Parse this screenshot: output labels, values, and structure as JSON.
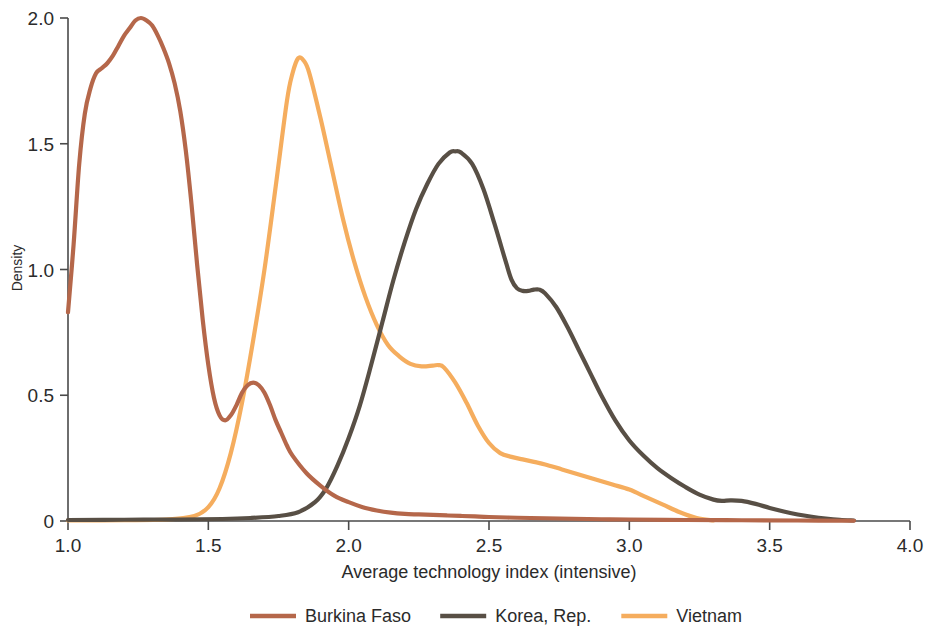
{
  "chart_data": {
    "type": "line",
    "title": "",
    "subtitle": "",
    "xlabel": "Average technology index (intensive)",
    "ylabel": "Density",
    "xlim": [
      1.0,
      4.0
    ],
    "ylim": [
      0,
      2.0
    ],
    "xticks": [
      1.0,
      1.5,
      2.0,
      2.5,
      3.0,
      3.5,
      4.0
    ],
    "xticklabels": [
      "1.0",
      "1.5",
      "2.0",
      "2.5",
      "3.0",
      "3.5",
      "4.0"
    ],
    "yticks": [
      0,
      0.5,
      1.0,
      1.5,
      2.0
    ],
    "yticklabels": [
      "0",
      "0.5",
      "1.0",
      "1.5",
      "2.0"
    ],
    "grid": false,
    "legend_position": "bottom",
    "series": [
      {
        "name": "Burkina Faso",
        "color": "#b5674a",
        "x": [
          1.0,
          1.02,
          1.04,
          1.06,
          1.08,
          1.1,
          1.12,
          1.14,
          1.16,
          1.18,
          1.2,
          1.22,
          1.24,
          1.26,
          1.28,
          1.3,
          1.32,
          1.34,
          1.36,
          1.38,
          1.4,
          1.42,
          1.44,
          1.46,
          1.48,
          1.5,
          1.52,
          1.54,
          1.56,
          1.58,
          1.6,
          1.62,
          1.64,
          1.66,
          1.68,
          1.7,
          1.72,
          1.74,
          1.76,
          1.78,
          1.8,
          1.85,
          1.9,
          1.95,
          2.0,
          2.05,
          2.1,
          2.15,
          2.2,
          2.25,
          2.3,
          2.35,
          2.4,
          2.45,
          2.5,
          2.6,
          2.7,
          2.8,
          2.9,
          3.0,
          3.2,
          3.4,
          3.6,
          3.8
        ],
        "y": [
          0.83,
          1.1,
          1.42,
          1.62,
          1.72,
          1.78,
          1.8,
          1.82,
          1.85,
          1.89,
          1.93,
          1.96,
          1.99,
          2.0,
          1.99,
          1.97,
          1.93,
          1.88,
          1.82,
          1.74,
          1.63,
          1.47,
          1.26,
          1.02,
          0.8,
          0.62,
          0.49,
          0.42,
          0.4,
          0.42,
          0.46,
          0.51,
          0.54,
          0.55,
          0.54,
          0.51,
          0.46,
          0.4,
          0.35,
          0.3,
          0.26,
          0.19,
          0.14,
          0.1,
          0.075,
          0.055,
          0.042,
          0.033,
          0.028,
          0.026,
          0.024,
          0.022,
          0.02,
          0.018,
          0.016,
          0.013,
          0.011,
          0.009,
          0.007,
          0.006,
          0.004,
          0.003,
          0.002,
          0.001
        ]
      },
      {
        "name": "Korea, Rep.",
        "color": "#584f45",
        "x": [
          1.0,
          1.2,
          1.4,
          1.55,
          1.65,
          1.75,
          1.82,
          1.88,
          1.92,
          1.96,
          2.0,
          2.04,
          2.08,
          2.12,
          2.16,
          2.2,
          2.24,
          2.28,
          2.32,
          2.36,
          2.38,
          2.4,
          2.44,
          2.48,
          2.52,
          2.56,
          2.58,
          2.6,
          2.62,
          2.64,
          2.66,
          2.68,
          2.7,
          2.74,
          2.78,
          2.82,
          2.86,
          2.9,
          2.95,
          3.0,
          3.05,
          3.1,
          3.15,
          3.2,
          3.25,
          3.3,
          3.33,
          3.36,
          3.4,
          3.45,
          3.5,
          3.55,
          3.6,
          3.65,
          3.7,
          3.75,
          3.8
        ],
        "y": [
          0.004,
          0.005,
          0.006,
          0.008,
          0.012,
          0.02,
          0.035,
          0.075,
          0.13,
          0.22,
          0.33,
          0.46,
          0.62,
          0.79,
          0.96,
          1.11,
          1.24,
          1.34,
          1.42,
          1.465,
          1.47,
          1.465,
          1.42,
          1.32,
          1.18,
          1.03,
          0.96,
          0.925,
          0.915,
          0.915,
          0.92,
          0.92,
          0.905,
          0.85,
          0.77,
          0.68,
          0.59,
          0.5,
          0.4,
          0.32,
          0.26,
          0.21,
          0.17,
          0.135,
          0.105,
          0.085,
          0.08,
          0.082,
          0.08,
          0.068,
          0.052,
          0.038,
          0.026,
          0.017,
          0.01,
          0.005,
          0.002
        ]
      },
      {
        "name": "Vietnam",
        "color": "#f5ad5e",
        "x": [
          1.0,
          1.2,
          1.35,
          1.45,
          1.5,
          1.54,
          1.58,
          1.62,
          1.66,
          1.7,
          1.74,
          1.78,
          1.8,
          1.82,
          1.84,
          1.86,
          1.9,
          1.94,
          1.98,
          2.02,
          2.06,
          2.1,
          2.14,
          2.18,
          2.22,
          2.26,
          2.3,
          2.32,
          2.34,
          2.38,
          2.42,
          2.46,
          2.5,
          2.54,
          2.58,
          2.62,
          2.66,
          2.7,
          2.76,
          2.82,
          2.88,
          2.94,
          3.0,
          3.06,
          3.12,
          3.18,
          3.24,
          3.3
        ],
        "y": [
          0.002,
          0.003,
          0.006,
          0.02,
          0.055,
          0.13,
          0.27,
          0.47,
          0.72,
          1.0,
          1.33,
          1.67,
          1.78,
          1.84,
          1.83,
          1.78,
          1.6,
          1.4,
          1.2,
          1.03,
          0.89,
          0.78,
          0.7,
          0.655,
          0.625,
          0.615,
          0.618,
          0.62,
          0.61,
          0.55,
          0.47,
          0.38,
          0.31,
          0.27,
          0.255,
          0.245,
          0.235,
          0.225,
          0.205,
          0.185,
          0.165,
          0.145,
          0.125,
          0.095,
          0.065,
          0.035,
          0.012,
          0.002
        ]
      }
    ]
  },
  "legend": {
    "items": [
      {
        "label": "Burkina Faso",
        "color": "#b5674a"
      },
      {
        "label": "Korea, Rep.",
        "color": "#584f45"
      },
      {
        "label": "Vietnam",
        "color": "#f5ad5e"
      }
    ]
  },
  "axes": {
    "x_title": "Average technology index (intensive)",
    "y_title": "Density"
  }
}
